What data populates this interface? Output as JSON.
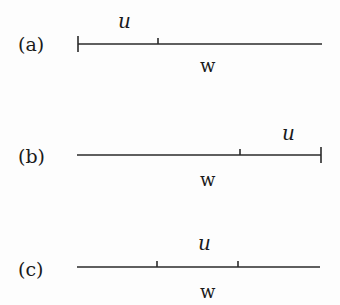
{
  "figure": {
    "panels": [
      {
        "id": "a",
        "label": "(a)",
        "segment_label": "u",
        "line_label": "w",
        "line": {
          "x1": 78,
          "x2": 322,
          "y": 44
        },
        "end_bars": [
          78
        ],
        "ticks": [
          158
        ],
        "label_pos": {
          "panel_x": 18,
          "panel_y": 51,
          "u_x": 118,
          "u_y": 28,
          "w_x": 200,
          "w_y": 72
        }
      },
      {
        "id": "b",
        "label": "(b)",
        "segment_label": "u",
        "line_label": "w",
        "line": {
          "x1": 77,
          "x2": 321,
          "y": 155
        },
        "end_bars": [
          321
        ],
        "ticks": [
          240
        ],
        "label_pos": {
          "panel_x": 18,
          "panel_y": 163,
          "u_x": 282,
          "u_y": 140,
          "w_x": 200,
          "w_y": 186
        }
      },
      {
        "id": "c",
        "label": "(c)",
        "segment_label": "u",
        "line_label": "w",
        "line": {
          "x1": 77,
          "x2": 320,
          "y": 267
        },
        "end_bars": [],
        "ticks": [
          157,
          238
        ],
        "label_pos": {
          "panel_x": 18,
          "panel_y": 276,
          "u_x": 198,
          "u_y": 250,
          "w_x": 200,
          "w_y": 298
        }
      }
    ]
  }
}
